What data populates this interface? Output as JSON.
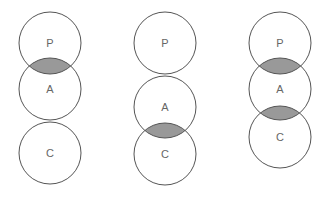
{
  "diagram": {
    "colors": {
      "stroke": "#555555",
      "overlap_fill": "#999999",
      "label": "#666666",
      "background": "#ffffff"
    },
    "radius": 31,
    "groups": [
      {
        "id": "group-1",
        "circles": [
          {
            "label": "P",
            "cx": 50,
            "cy": 43
          },
          {
            "label": "A",
            "cx": 50,
            "cy": 89
          },
          {
            "label": "C",
            "cx": 50,
            "cy": 153
          }
        ],
        "overlaps": [
          [
            "P",
            "A"
          ]
        ]
      },
      {
        "id": "group-2",
        "circles": [
          {
            "label": "P",
            "cx": 165,
            "cy": 43
          },
          {
            "label": "A",
            "cx": 165,
            "cy": 107
          },
          {
            "label": "C",
            "cx": 165,
            "cy": 154
          }
        ],
        "overlaps": [
          [
            "A",
            "C"
          ]
        ]
      },
      {
        "id": "group-3",
        "circles": [
          {
            "label": "P",
            "cx": 280,
            "cy": 43
          },
          {
            "label": "A",
            "cx": 280,
            "cy": 89
          },
          {
            "label": "C",
            "cx": 280,
            "cy": 137
          }
        ],
        "overlaps": [
          [
            "P",
            "A"
          ],
          [
            "A",
            "C"
          ]
        ]
      }
    ]
  }
}
